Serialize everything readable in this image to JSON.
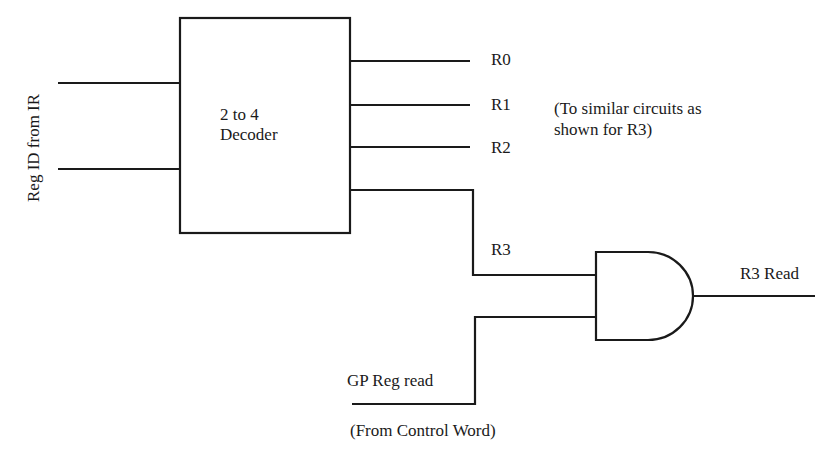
{
  "diagram": {
    "inputs_label": "Reg ID from IR",
    "decoder": {
      "line1": "2 to 4",
      "line2": "Decoder"
    },
    "outputs": [
      "R0",
      "R1",
      "R2",
      "R3"
    ],
    "note": {
      "line1": "(To similar circuits as",
      "line2": "shown for R3)"
    },
    "gate": {
      "type": "AND",
      "output_label": "R3 Read"
    },
    "control": {
      "label": "GP Reg read",
      "source": "(From Control Word)"
    }
  }
}
